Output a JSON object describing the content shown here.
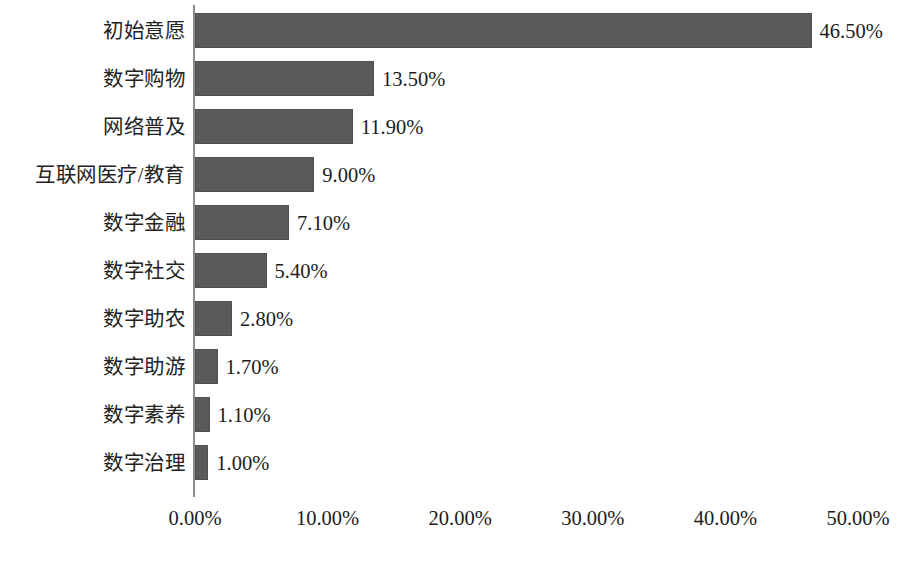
{
  "chart_data": {
    "type": "bar",
    "orientation": "horizontal",
    "title": "",
    "subtitle": "",
    "xlabel": "",
    "ylabel": "",
    "xlim": [
      0,
      50
    ],
    "grid": false,
    "legend": null,
    "bar_color": "#5a5a5a",
    "axis_color": "#8c8c8c",
    "background": "#ffffff",
    "categories": [
      "初始意愿",
      "数字购物",
      "网络普及",
      "互联网医疗/教育",
      "数字金融",
      "数字社交",
      "数字助农",
      "数字助游",
      "数字素养",
      "数字治理"
    ],
    "values": [
      46.5,
      13.5,
      11.9,
      9.0,
      7.1,
      5.4,
      2.8,
      1.7,
      1.1,
      1.0
    ],
    "data_labels": [
      "46.50%",
      "13.50%",
      "11.90%",
      "9.00%",
      "7.10%",
      "5.40%",
      "2.80%",
      "1.70%",
      "1.10%",
      "1.00%"
    ],
    "xticks": [
      0,
      10,
      20,
      30,
      40,
      50
    ],
    "xtick_labels": [
      "0.00%",
      "10.00%",
      "20.00%",
      "30.00%",
      "40.00%",
      "50.00%"
    ]
  }
}
